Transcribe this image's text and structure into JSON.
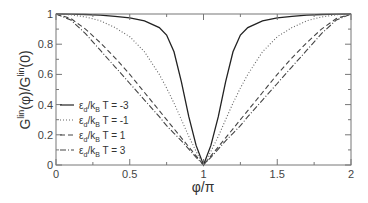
{
  "chart_data": {
    "type": "line",
    "title": "",
    "xlabel": "φ/π",
    "ylabel": "G^lin(φ)/G^lin(0)",
    "xlim": [
      0,
      2
    ],
    "ylim": [
      0,
      1
    ],
    "x_ticks": [
      "0",
      "0.5",
      "1",
      "1.5",
      "2"
    ],
    "y_ticks": [
      "0",
      "0.2",
      "0.4",
      "0.6",
      "0.8",
      "1"
    ],
    "grid": false,
    "legend_position": "lower-left inside",
    "x": [
      0,
      0.1,
      0.2,
      0.3,
      0.4,
      0.5,
      0.6,
      0.7,
      0.75,
      0.8,
      0.85,
      0.9,
      0.95,
      1.0
    ],
    "series": [
      {
        "name": "εd/kBT = -3",
        "style": "solid",
        "values": [
          1,
          0.999,
          0.997,
          0.993,
          0.985,
          0.975,
          0.955,
          0.91,
          0.86,
          0.75,
          0.55,
          0.32,
          0.13,
          0
        ]
      },
      {
        "name": "εd/kBT = -1",
        "style": "dotted",
        "values": [
          1,
          0.995,
          0.98,
          0.955,
          0.91,
          0.85,
          0.75,
          0.6,
          0.51,
          0.41,
          0.3,
          0.19,
          0.09,
          0
        ]
      },
      {
        "name": "εd/kBT = 1",
        "style": "dashed",
        "values": [
          1,
          0.97,
          0.9,
          0.81,
          0.71,
          0.6,
          0.48,
          0.36,
          0.3,
          0.24,
          0.18,
          0.12,
          0.06,
          0
        ]
      },
      {
        "name": "εd/kBT = 3",
        "style": "dash-dot",
        "values": [
          1,
          0.96,
          0.87,
          0.76,
          0.65,
          0.54,
          0.43,
          0.32,
          0.26,
          0.21,
          0.16,
          0.105,
          0.05,
          0
        ]
      }
    ],
    "symmetry": "curves symmetric about φ/π = 1"
  },
  "labels": {
    "xlabel": "φ/π",
    "ylabel_parts": [
      "G",
      "lin",
      "(φ)/G",
      "lin",
      "(0)"
    ]
  },
  "legend": [
    {
      "eps": "ε",
      "sub": "d",
      "mid": "/k",
      "sub2": "B",
      "rest": "T = -3"
    },
    {
      "eps": "ε",
      "sub": "d",
      "mid": "/k",
      "sub2": "B",
      "rest": "T = -1"
    },
    {
      "eps": "ε",
      "sub": "d",
      "mid": "/k",
      "sub2": "B",
      "rest": "T = 1"
    },
    {
      "eps": "ε",
      "sub": "d",
      "mid": "/k",
      "sub2": "B",
      "rest": "T = 3"
    }
  ]
}
